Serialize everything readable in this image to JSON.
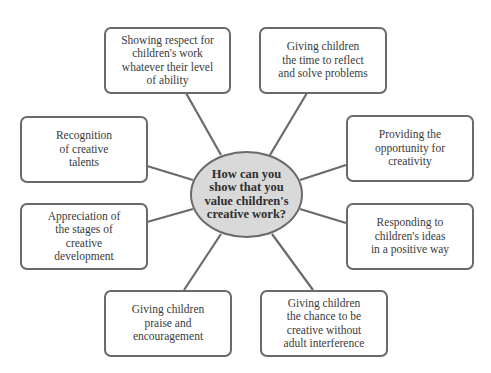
{
  "diagram": {
    "type": "spider-diagram",
    "center": {
      "text": "How can you\nshow that you\nvalue children's\ncreative work?"
    },
    "nodes": [
      {
        "id": "respect",
        "text": "Showing respect for\nchildren's work\nwhatever their level\nof ability"
      },
      {
        "id": "time",
        "text": "Giving children\nthe time to reflect\nand solve problems"
      },
      {
        "id": "recognition",
        "text": "Recognition\nof creative\ntalents"
      },
      {
        "id": "opportunity",
        "text": "Providing the\nopportunity for\ncreativity"
      },
      {
        "id": "appreciation",
        "text": "Appreciation of\nthe stages of\ncreative\ndevelopment"
      },
      {
        "id": "responding",
        "text": "Responding to\nchildren's ideas\nin a positive way"
      },
      {
        "id": "praise",
        "text": "Giving children\npraise and\nencouragement"
      },
      {
        "id": "chance",
        "text": "Giving children\nthe chance to be\ncreative without\nadult interference"
      }
    ],
    "colors": {
      "border": "#6a6a6a",
      "center_fill": "#d9d9d9",
      "box_fill": "#ffffff",
      "text": "#3a3a3a"
    }
  }
}
